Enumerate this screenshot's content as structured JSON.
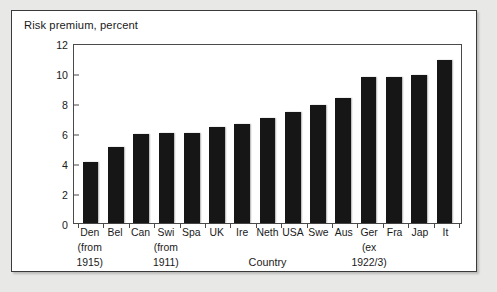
{
  "figure": {
    "title": "Risk premium, percent",
    "frame_color": "#3a3a3a",
    "bar_color": "#161616",
    "paper_color": "#e8e8e6",
    "plot_background": "#ffffff"
  },
  "chart_data": {
    "type": "bar",
    "title": "Risk premium, percent",
    "xlabel": "Country",
    "ylabel": "Risk premium, percent",
    "ylim": [
      0,
      12
    ],
    "yticks": [
      0,
      2,
      4,
      6,
      8,
      10,
      12
    ],
    "ytick_labels": [
      "0",
      "2",
      "4",
      "6",
      "8",
      "10",
      "12"
    ],
    "grid": false,
    "legend": "none",
    "categories": [
      "Den",
      "Bel",
      "Can",
      "Swi",
      "Spa",
      "UK",
      "Ire",
      "Neth",
      "USA",
      "Swe",
      "Aus",
      "Ger",
      "Fra",
      "Jap",
      "It"
    ],
    "values": [
      4.1,
      5.05,
      5.95,
      6.0,
      6.0,
      6.4,
      6.6,
      7.0,
      7.4,
      7.85,
      8.35,
      9.75,
      9.75,
      9.85,
      10.85
    ],
    "annotations": [
      {
        "category": "Den",
        "lines": [
          "(from",
          "1915)"
        ]
      },
      {
        "category": "Swi",
        "lines": [
          "(from",
          "1911)"
        ]
      },
      {
        "category": "Ger",
        "lines": [
          "(ex",
          "1922/3)"
        ]
      }
    ]
  },
  "axis": {
    "y_ticks": [
      "12",
      "10",
      "8",
      "6",
      "4",
      "2",
      "0"
    ],
    "x_title": "Country"
  },
  "x_notes": {
    "den_line1": "(from",
    "den_line2": "1915)",
    "swi_line1": "(from",
    "swi_line2": "1911)",
    "ger_line1": "(ex",
    "ger_line2": "1922/3)"
  }
}
